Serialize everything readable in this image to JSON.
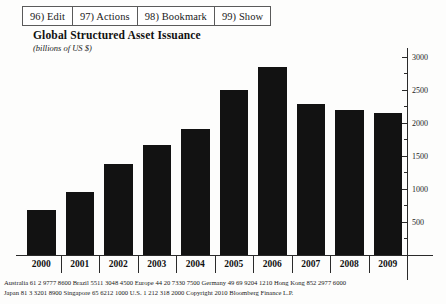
{
  "toolbar": {
    "buttons": [
      {
        "label": "96) Edit",
        "name": "edit"
      },
      {
        "label": "97) Actions",
        "name": "actions"
      },
      {
        "label": "98) Bookmark",
        "name": "bookmark"
      },
      {
        "label": "99) Show",
        "name": "show"
      }
    ]
  },
  "chart_data": {
    "type": "bar",
    "title": "Global Structured Asset Issuance",
    "subtitle": "(billions of US $)",
    "xlabel": "",
    "ylabel": "",
    "categories": [
      "2000",
      "2001",
      "2002",
      "2003",
      "2004",
      "2005",
      "2006",
      "2007",
      "2008",
      "2009"
    ],
    "values": [
      680,
      950,
      1370,
      1670,
      1900,
      2500,
      2850,
      2280,
      2200,
      2150
    ],
    "ylim": [
      0,
      3100
    ],
    "yticks": [
      500,
      1000,
      1500,
      2000,
      2500,
      3000
    ],
    "ytick_labels": [
      "500",
      "1000",
      "1500",
      "2000",
      "2500",
      "3000"
    ],
    "grid": false,
    "legend": null,
    "bar_color": "#121212",
    "axis_color": "#2a2a2a"
  },
  "footer": {
    "line1": "Australia   61  2 9777  8600  Brazil   5511 3048 4500  Europe 44  20 7330 7500   Germany 49 69 9204 1210  Hong Kong 852  2977 6000",
    "line2": "Japan 81 3  3201  8900             Singapore  65 6212 1000            U.S.   1  212   318  2000            Copyright 2010  Bloomberg Finance L.P."
  }
}
